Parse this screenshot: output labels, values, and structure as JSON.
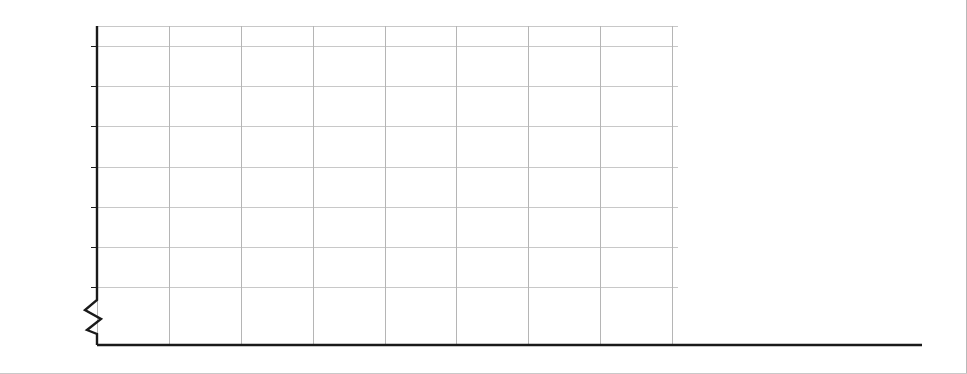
{
  "chart_data": {
    "type": "line",
    "title": "",
    "subtitle": "",
    "xlabel": "",
    "ylabel": "",
    "x": [
      1976,
      1980,
      1984,
      1988,
      1992,
      1996,
      2000,
      2004,
      2008
    ],
    "categories": [
      "1976",
      "1980",
      "1984",
      "1988",
      "1992",
      "1996",
      "2000",
      "2004",
      "2008"
    ],
    "ylim": [
      20,
      85
    ],
    "yticks": [
      20,
      30,
      40,
      50,
      60,
      70,
      80
    ],
    "ytick_labels": [
      "20%",
      "30%",
      "40%",
      "50%",
      "60%",
      "70%",
      "80%"
    ],
    "zero_tick_label": "0%",
    "axis_break": true,
    "grid": true,
    "grid_x": true,
    "grid_y": true,
    "legend_position": "right-inline-arrows",
    "legend_arrow_glyph": "←",
    "series": [
      {
        "name": "College graduate",
        "color": "#333333",
        "label_y_value": 73.5,
        "values": [
          80.2,
          79.9,
          79.1,
          77.6,
          81.3,
          73.0,
          72.0,
          74.2,
          73.4
        ]
      },
      {
        "name": "Some college",
        "color": "#9a9a9a",
        "label_y_value": 65.5,
        "values": [
          68.1,
          67.2,
          67.5,
          64.5,
          69.4,
          60.5,
          60.3,
          66.1,
          65.0
        ]
      },
      {
        "name": "High school graduate",
        "color": "#555555",
        "label_y_value": 51.0,
        "values": [
          59.4,
          58.9,
          58.7,
          54.7,
          57.5,
          49.1,
          49.4,
          52.4,
          50.9
        ]
      },
      {
        "name": "Some high school",
        "color": "#a8a8a8",
        "label_y_value": 34.0,
        "values": [
          47.2,
          45.6,
          42.9,
          41.3,
          41.2,
          33.8,
          33.6,
          34.6,
          33.7
        ]
      },
      {
        "name": "8 grades or less",
        "color": "#696969",
        "label_y_value": 23.5,
        "values": [
          44.1,
          42.6,
          42.9,
          36.7,
          35.1,
          28.1,
          26.8,
          23.6,
          23.5
        ]
      }
    ]
  },
  "axis": {
    "y_labels": [
      "80%",
      "70%",
      "60%",
      "50%",
      "40%",
      "30%",
      "20%",
      "0%"
    ],
    "x_labels": [
      "1976",
      "1980",
      "1984",
      "1988",
      "1992",
      "1996",
      "2000",
      "2004",
      "2008"
    ]
  },
  "legend": {
    "arrow": "←",
    "items": [
      {
        "label": "College graduate"
      },
      {
        "label": "Some college"
      },
      {
        "label": "High school graduate"
      },
      {
        "label": "Some high school"
      },
      {
        "label": "8 grades or less"
      }
    ]
  },
  "colors": {
    "college_graduate": "#333333",
    "some_college": "#9a9a9a",
    "high_school_graduate": "#555555",
    "some_high_school": "#a8a8a8",
    "eight_grades_or_less": "#696969",
    "grid": "#c8c8c8",
    "axis": "#1a1a1a",
    "text": "#231f20",
    "background": "#ffffff"
  }
}
